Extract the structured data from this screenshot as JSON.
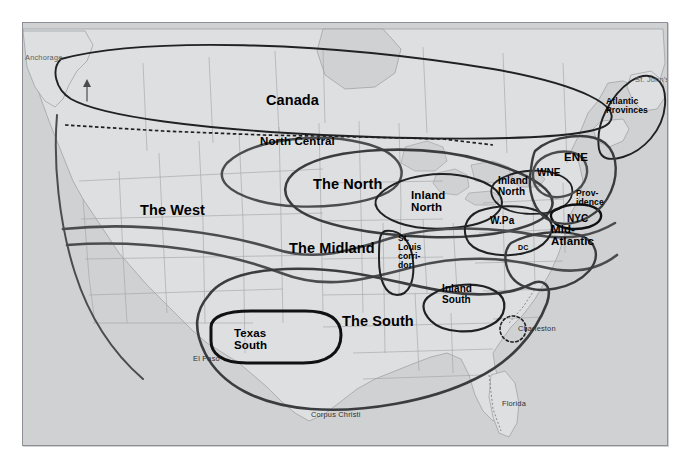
{
  "map": {
    "title": "Dialect Regions of North America",
    "background_color": "#d9dadb",
    "land_color": "#dedfe0",
    "ocean_color": "#cfd1d2",
    "border_color": "#8d9094",
    "isogloss_color": "#3b3d3f",
    "state_line_color": "#9a9da0",
    "regions": [
      {
        "id": "canada",
        "label": "Canada",
        "x": 265,
        "y": 92,
        "size": "big"
      },
      {
        "id": "north-central",
        "label": "North Central",
        "x": 259,
        "y": 134,
        "size": "med"
      },
      {
        "id": "the-west",
        "label": "The West",
        "x": 139,
        "y": 202,
        "size": "big"
      },
      {
        "id": "the-north",
        "label": "The North",
        "x": 312,
        "y": 176,
        "size": "big"
      },
      {
        "id": "the-midland",
        "label": "The Midland",
        "x": 288,
        "y": 240,
        "size": "big"
      },
      {
        "id": "the-south",
        "label": "The South",
        "x": 341,
        "y": 313,
        "size": "big"
      },
      {
        "id": "texas-south",
        "label": "Texas\nSouth",
        "x": 233,
        "y": 326,
        "size": "med"
      },
      {
        "id": "inland-north-west",
        "label": "Inland\nNorth",
        "x": 410,
        "y": 188,
        "size": "med"
      },
      {
        "id": "inland-north-east",
        "label": "Inland\nNorth",
        "x": 497,
        "y": 175,
        "size": "sm"
      },
      {
        "id": "inland-south",
        "label": "Inland\nSouth",
        "x": 441,
        "y": 283,
        "size": "sm"
      },
      {
        "id": "st-louis-corridor",
        "label": "St.\nLouis\ncorri-\ndor",
        "x": 397,
        "y": 233,
        "size": "xs"
      },
      {
        "id": "w-pa",
        "label": "W.Pa",
        "x": 489,
        "y": 215,
        "size": "sm"
      },
      {
        "id": "ene",
        "label": "ENE",
        "x": 563,
        "y": 150,
        "size": "med"
      },
      {
        "id": "wne",
        "label": "WNE",
        "x": 536,
        "y": 167,
        "size": "sm"
      },
      {
        "id": "nyc",
        "label": "NYC",
        "x": 566,
        "y": 213,
        "size": "sm"
      },
      {
        "id": "mid-atlantic",
        "label": "Mid-\nAtlantic",
        "x": 550,
        "y": 222,
        "size": "med"
      },
      {
        "id": "providence",
        "label": "Prov-\nidence",
        "x": 575,
        "y": 188,
        "size": "xs"
      },
      {
        "id": "atlantic-provinces",
        "label": "Atlantic\nProvinces",
        "x": 605,
        "y": 96,
        "size": "xs"
      },
      {
        "id": "dc",
        "label": "DC",
        "x": 517,
        "y": 243,
        "size": "tiny"
      }
    ],
    "cities": [
      {
        "id": "anchorage",
        "label": "Anchorage",
        "x": 24,
        "y": 52,
        "faint": true
      },
      {
        "id": "st-johns",
        "label": "St. John's",
        "x": 634,
        "y": 74,
        "faint": true
      },
      {
        "id": "el-paso",
        "label": "El Paso",
        "x": 192,
        "y": 353,
        "faint": false
      },
      {
        "id": "corpus-christi",
        "label": "Corpus Christi",
        "x": 310,
        "y": 409,
        "faint": false
      },
      {
        "id": "charleston",
        "label": "Charleston",
        "x": 517,
        "y": 323,
        "faint": false
      },
      {
        "id": "florida",
        "label": "Florida",
        "x": 501,
        "y": 398,
        "faint": false
      }
    ]
  }
}
